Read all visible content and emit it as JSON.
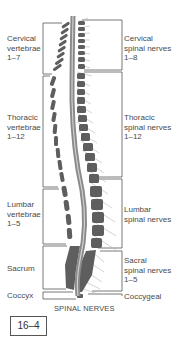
{
  "left_labels": {
    "cervical": "Cervical\nvertebrae\n1–7",
    "thoracic": "Thoracic\nvertebrae\n1–12",
    "lumbar": "Lumbar\nvertebrae\n1–5",
    "sacrum": "Sacrum",
    "coccyx": "Coccyx"
  },
  "right_labels": {
    "cervical": "Cervical\nspinal nerves\n1–8",
    "thoracic": "Thoracic\nspinal nerves\n1–12",
    "lumbar": "Lumbar\nspinal nerves",
    "sacral": "Sacral\nspinal nerves\n1–5",
    "coccygeal": "Coccygeal"
  },
  "caption": "SPINAL NERVES",
  "figure_number": "16–4",
  "colors": {
    "vertebra": "#5a5a5a",
    "cord": "#8a8a8a",
    "nerve": "#b0b0b0",
    "box": "#555555"
  }
}
